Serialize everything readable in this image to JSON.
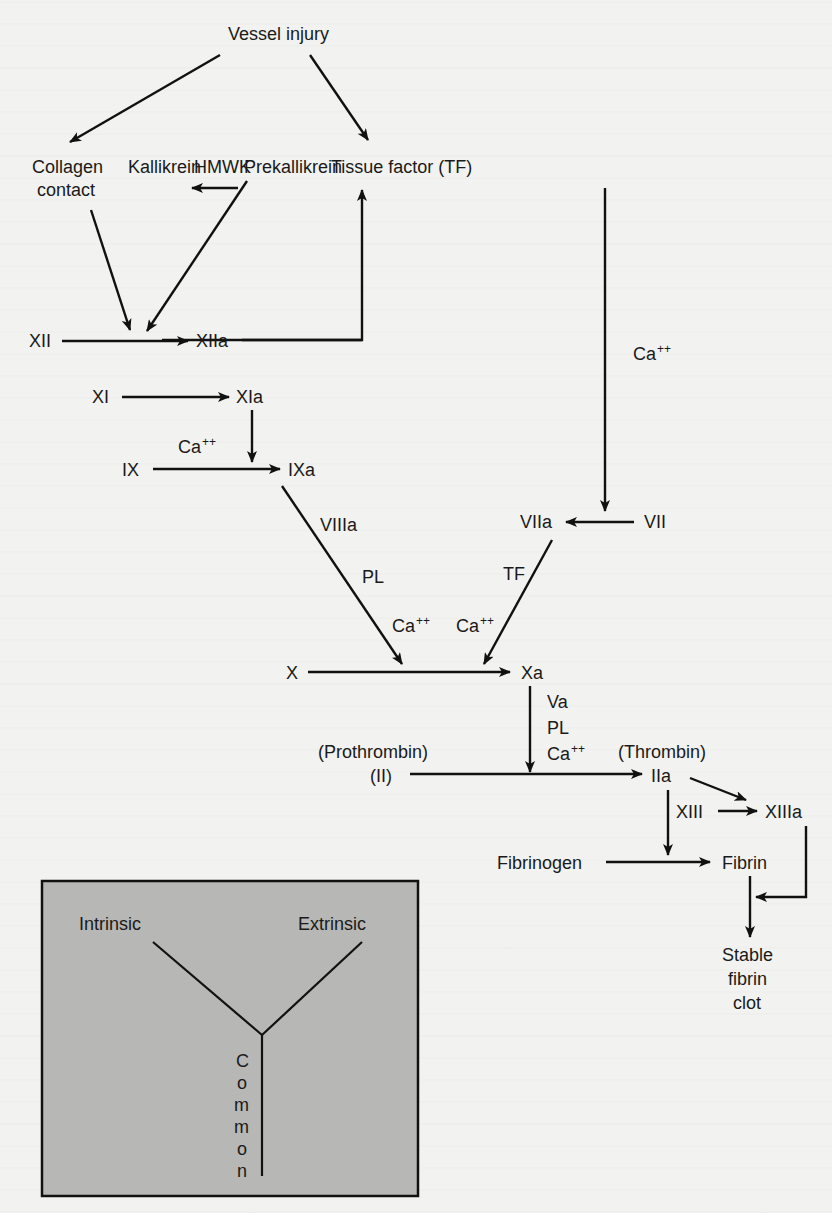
{
  "diagram": {
    "nodes": {
      "vessel_injury": "Vessel injury",
      "collagen_contact_1": "Collagen",
      "collagen_contact_2": "contact",
      "kallikrein": "Kallikrein",
      "hmwk": "HMWK",
      "prekallikrein": "Prekallikrein",
      "tissue_factor": "Tissue factor (TF)",
      "xii": "XII",
      "xiia": "XIIa",
      "xi": "XI",
      "xia": "XIa",
      "ix": "IX",
      "ixa": "IXa",
      "vii": "VII",
      "viia": "VIIa",
      "x": "X",
      "xa": "Xa",
      "prothrombin_label": "(Prothrombin)",
      "ii": "(II)",
      "thrombin_label": "(Thrombin)",
      "iia": "IIa",
      "xiii": "XIII",
      "xiiia": "XIIIa",
      "fibrinogen": "Fibrinogen",
      "fibrin": "Fibrin",
      "stable_1": "Stable",
      "stable_2": "fibrin",
      "stable_3": "clot"
    },
    "cofactors": {
      "ca_ext": "Ca",
      "ca_ext_sup": "++",
      "ca_ix": "Ca",
      "ca_ix_sup": "++",
      "viiia": "VIIIa",
      "pl_int": "PL",
      "ca_int_x": "Ca",
      "ca_int_x_sup": "++",
      "tf": "TF",
      "ca_ext_x": "Ca",
      "ca_ext_x_sup": "++",
      "va": "Va",
      "pl_common": "PL",
      "ca_common": "Ca",
      "ca_common_sup": "++"
    },
    "legend": {
      "intrinsic": "Intrinsic",
      "extrinsic": "Extrinsic",
      "common_letters": [
        "C",
        "o",
        "m",
        "m",
        "o",
        "n"
      ]
    },
    "colors": {
      "background": "#f2f2f0",
      "ink": "#111111",
      "legend_fill": "#b7b7b5"
    }
  }
}
